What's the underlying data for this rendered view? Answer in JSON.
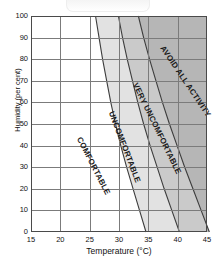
{
  "chart_data": {
    "type": "area",
    "title": "",
    "xlabel": "Temperature (°C)",
    "ylabel": "Humidity (per cent)",
    "xlim": [
      15,
      45
    ],
    "ylim": [
      0,
      100
    ],
    "xticks": [
      15,
      20,
      25,
      30,
      35,
      40,
      45
    ],
    "yticks": [
      0,
      10,
      20,
      30,
      40,
      50,
      60,
      70,
      80,
      90,
      100
    ],
    "grid": true,
    "legend_position": "none",
    "zones": [
      {
        "name": "COMFORTABLE",
        "fill": "#ffffff",
        "label_x": 23.2,
        "label_y": 46,
        "label_angle": 63
      },
      {
        "name": "UNCOMFORTABLE",
        "fill": "#e2e2e2",
        "label_x": 28.6,
        "label_y": 58,
        "label_angle": 69
      },
      {
        "name": "VERY UNCOMFORTABLE",
        "fill": "#cacaca",
        "label_x": 32.8,
        "label_y": 71,
        "label_angle": 64
      },
      {
        "name": "AVOID ALL ACTIVITY",
        "fill": "#b6b6b6",
        "label_x": 37.4,
        "label_y": 88,
        "label_angle": 56
      }
    ],
    "boundaries": [
      {
        "name": "comfortable-uncomfortable",
        "points": [
          [
            26.0,
            100
          ],
          [
            26.6,
            90
          ],
          [
            27.2,
            80
          ],
          [
            27.9,
            70
          ],
          [
            28.6,
            60
          ],
          [
            29.4,
            50
          ],
          [
            30.3,
            40
          ],
          [
            31.3,
            30
          ],
          [
            32.4,
            20
          ],
          [
            33.5,
            10
          ],
          [
            34.6,
            0
          ]
        ]
      },
      {
        "name": "uncomfortable-very-uncomfortable",
        "points": [
          [
            29.9,
            100
          ],
          [
            30.6,
            90
          ],
          [
            31.4,
            80
          ],
          [
            32.3,
            70
          ],
          [
            33.2,
            60
          ],
          [
            34.2,
            50
          ],
          [
            35.3,
            40
          ],
          [
            36.5,
            30
          ],
          [
            37.7,
            20
          ],
          [
            39.0,
            10
          ],
          [
            40.3,
            0
          ]
        ]
      },
      {
        "name": "very-uncomfortable-avoid-all-activity",
        "points": [
          [
            33.3,
            100
          ],
          [
            34.2,
            90
          ],
          [
            35.2,
            80
          ],
          [
            36.3,
            70
          ],
          [
            37.4,
            60
          ],
          [
            38.6,
            50
          ],
          [
            39.9,
            40
          ],
          [
            41.2,
            30
          ],
          [
            42.6,
            20
          ],
          [
            44.0,
            10
          ],
          [
            45.4,
            0
          ]
        ]
      }
    ],
    "colors": {
      "axis": "#4a4a4a",
      "grid": "#7b7b7b",
      "curve": "#3c3c3c",
      "text": "#111111"
    }
  }
}
